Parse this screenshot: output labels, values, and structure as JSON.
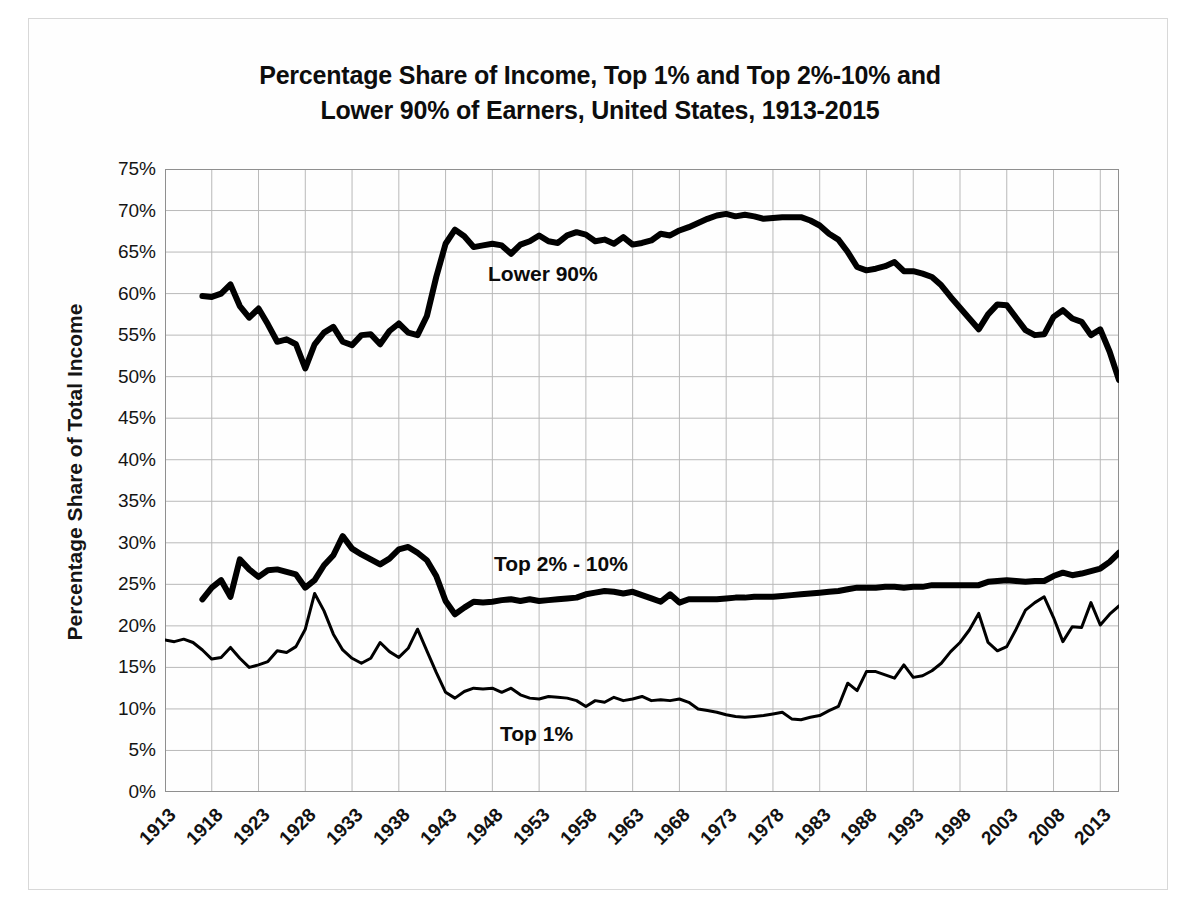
{
  "chart_data": {
    "type": "line",
    "title": "Percentage Share of Income, Top 1% and Top 2%-10% and Lower 90% of Earners, United States, 1913-2015",
    "title_line1": "Percentage Share of Income, Top 1% and Top 2%-10% and",
    "title_line2": "Lower 90% of Earners, United States, 1913-2015",
    "xlabel": "",
    "ylabel": "Percentage Share of Total Income",
    "ylim": [
      0,
      75
    ],
    "xlim": [
      1913,
      2015
    ],
    "grid": true,
    "legend_position": "inline-annotations",
    "ytick_labels": [
      "75%",
      "70%",
      "65%",
      "60%",
      "55%",
      "50%",
      "45%",
      "40%",
      "35%",
      "30%",
      "25%",
      "20%",
      "15%",
      "10%",
      "5%",
      "0%"
    ],
    "ytick_values": [
      75,
      70,
      65,
      60,
      55,
      50,
      45,
      40,
      35,
      30,
      25,
      20,
      15,
      10,
      5,
      0
    ],
    "xtick_labels": [
      "1913",
      "1918",
      "1923",
      "1928",
      "1933",
      "1938",
      "1943",
      "1948",
      "1953",
      "1958",
      "1963",
      "1968",
      "1973",
      "1978",
      "1983",
      "1988",
      "1993",
      "1998",
      "2003",
      "2008",
      "2013"
    ],
    "xtick_values": [
      1913,
      1918,
      1923,
      1928,
      1933,
      1938,
      1943,
      1948,
      1953,
      1958,
      1963,
      1968,
      1973,
      1978,
      1983,
      1988,
      1993,
      1998,
      2003,
      2008,
      2013
    ],
    "annotations": [
      {
        "text": "Lower 90%",
        "series": "Lower 90%"
      },
      {
        "text": "Top 2% - 10%",
        "series": "Top 2% - 10%"
      },
      {
        "text": "Top 1%",
        "series": "Top 1%"
      }
    ],
    "series": [
      {
        "name": "Lower 90%",
        "color": "#000000",
        "line_width": 6,
        "x": [
          1917,
          1918,
          1919,
          1920,
          1921,
          1922,
          1923,
          1924,
          1925,
          1926,
          1927,
          1928,
          1929,
          1930,
          1931,
          1932,
          1933,
          1934,
          1935,
          1936,
          1937,
          1938,
          1939,
          1940,
          1941,
          1942,
          1943,
          1944,
          1945,
          1946,
          1947,
          1948,
          1949,
          1950,
          1951,
          1952,
          1953,
          1954,
          1955,
          1956,
          1957,
          1958,
          1959,
          1960,
          1961,
          1962,
          1963,
          1964,
          1965,
          1966,
          1967,
          1968,
          1969,
          1970,
          1971,
          1972,
          1973,
          1974,
          1975,
          1976,
          1977,
          1978,
          1979,
          1980,
          1981,
          1982,
          1983,
          1984,
          1985,
          1986,
          1987,
          1988,
          1989,
          1990,
          1991,
          1992,
          1993,
          1994,
          1995,
          1996,
          1997,
          1998,
          1999,
          2000,
          2001,
          2002,
          2003,
          2004,
          2005,
          2006,
          2007,
          2008,
          2009,
          2010,
          2011,
          2012,
          2013,
          2014,
          2015
        ],
        "y": [
          59.7,
          59.6,
          60.0,
          61.1,
          58.5,
          57.1,
          58.2,
          56.3,
          54.2,
          54.5,
          53.9,
          51.0,
          53.9,
          55.3,
          56.0,
          54.2,
          53.8,
          55.0,
          55.1,
          53.9,
          55.5,
          56.4,
          55.3,
          55.0,
          57.3,
          62.0,
          66.0,
          67.7,
          66.9,
          65.6,
          65.8,
          66.0,
          65.8,
          64.8,
          65.9,
          66.3,
          67.0,
          66.3,
          66.1,
          67.0,
          67.4,
          67.1,
          66.3,
          66.5,
          66.0,
          66.8,
          65.9,
          66.1,
          66.4,
          67.2,
          67.0,
          67.6,
          68.0,
          68.5,
          69.0,
          69.4,
          69.6,
          69.3,
          69.5,
          69.3,
          69.0,
          69.1,
          69.2,
          69.2,
          69.2,
          68.8,
          68.2,
          67.2,
          66.5,
          65.0,
          63.2,
          62.8,
          63.0,
          63.3,
          63.8,
          62.7,
          62.7,
          62.4,
          62.0,
          61.0,
          59.6,
          58.3,
          57.0,
          55.7,
          57.5,
          58.7,
          58.6,
          57.1,
          55.6,
          55.0,
          55.1,
          57.2,
          58.0,
          57.0,
          56.6,
          55.0,
          55.7,
          53.0,
          49.6
        ]
      },
      {
        "name": "Top 2% - 10%",
        "color": "#000000",
        "line_width": 6,
        "x": [
          1917,
          1918,
          1919,
          1920,
          1921,
          1922,
          1923,
          1924,
          1925,
          1926,
          1927,
          1928,
          1929,
          1930,
          1931,
          1932,
          1933,
          1934,
          1935,
          1936,
          1937,
          1938,
          1939,
          1940,
          1941,
          1942,
          1943,
          1944,
          1945,
          1946,
          1947,
          1948,
          1949,
          1950,
          1951,
          1952,
          1953,
          1954,
          1955,
          1956,
          1957,
          1958,
          1959,
          1960,
          1961,
          1962,
          1963,
          1964,
          1965,
          1966,
          1967,
          1968,
          1969,
          1970,
          1971,
          1972,
          1973,
          1974,
          1975,
          1976,
          1977,
          1978,
          1979,
          1980,
          1981,
          1982,
          1983,
          1984,
          1985,
          1986,
          1987,
          1988,
          1989,
          1990,
          1991,
          1992,
          1993,
          1994,
          1995,
          1996,
          1997,
          1998,
          1999,
          2000,
          2001,
          2002,
          2003,
          2004,
          2005,
          2006,
          2007,
          2008,
          2009,
          2010,
          2011,
          2012,
          2013,
          2014,
          2015
        ],
        "y": [
          23.2,
          24.6,
          25.5,
          23.5,
          28.0,
          26.8,
          25.9,
          26.7,
          26.8,
          26.5,
          26.2,
          24.6,
          25.5,
          27.3,
          28.5,
          30.8,
          29.3,
          28.6,
          28.0,
          27.4,
          28.1,
          29.2,
          29.5,
          28.8,
          27.9,
          26.0,
          23.0,
          21.4,
          22.2,
          22.9,
          22.8,
          22.9,
          23.1,
          23.2,
          23.0,
          23.2,
          23.0,
          23.1,
          23.2,
          23.3,
          23.4,
          23.8,
          24.0,
          24.2,
          24.1,
          23.9,
          24.1,
          23.7,
          23.3,
          22.9,
          23.8,
          22.8,
          23.2,
          23.2,
          23.2,
          23.2,
          23.3,
          23.4,
          23.4,
          23.5,
          23.5,
          23.5,
          23.6,
          23.7,
          23.8,
          23.9,
          24.0,
          24.1,
          24.2,
          24.4,
          24.6,
          24.6,
          24.6,
          24.7,
          24.7,
          24.6,
          24.7,
          24.7,
          24.9,
          24.9,
          24.9,
          24.9,
          24.9,
          24.9,
          25.3,
          25.4,
          25.5,
          25.4,
          25.3,
          25.4,
          25.4,
          26.0,
          26.4,
          26.1,
          26.3,
          26.6,
          26.9,
          27.7,
          28.8
        ]
      },
      {
        "name": "Top 1%",
        "color": "#000000",
        "line_width": 3,
        "x": [
          1913,
          1914,
          1915,
          1916,
          1917,
          1918,
          1919,
          1920,
          1921,
          1922,
          1923,
          1924,
          1925,
          1926,
          1927,
          1928,
          1929,
          1930,
          1931,
          1932,
          1933,
          1934,
          1935,
          1936,
          1937,
          1938,
          1939,
          1940,
          1941,
          1942,
          1943,
          1944,
          1945,
          1946,
          1947,
          1948,
          1949,
          1950,
          1951,
          1952,
          1953,
          1954,
          1955,
          1956,
          1957,
          1958,
          1959,
          1960,
          1961,
          1962,
          1963,
          1964,
          1965,
          1966,
          1967,
          1968,
          1969,
          1970,
          1971,
          1972,
          1973,
          1974,
          1975,
          1976,
          1977,
          1978,
          1979,
          1980,
          1981,
          1982,
          1983,
          1984,
          1985,
          1986,
          1987,
          1988,
          1989,
          1990,
          1991,
          1992,
          1993,
          1994,
          1995,
          1996,
          1997,
          1998,
          1999,
          2000,
          2001,
          2002,
          2003,
          2004,
          2005,
          2006,
          2007,
          2008,
          2009,
          2010,
          2011,
          2012,
          2013,
          2014,
          2015
        ],
        "y": [
          18.3,
          18.1,
          18.4,
          18.0,
          17.1,
          16.0,
          16.2,
          17.4,
          16.1,
          15.0,
          15.3,
          15.7,
          17.0,
          16.8,
          17.5,
          19.6,
          23.9,
          21.8,
          19.0,
          17.1,
          16.1,
          15.5,
          16.1,
          18.0,
          16.9,
          16.2,
          17.3,
          19.6,
          17.0,
          14.4,
          12.0,
          11.3,
          12.1,
          12.5,
          12.4,
          12.5,
          12.0,
          12.5,
          11.7,
          11.3,
          11.2,
          11.5,
          11.4,
          11.3,
          11.0,
          10.3,
          11.0,
          10.8,
          11.4,
          11.0,
          11.2,
          11.5,
          11.0,
          11.1,
          11.0,
          11.2,
          10.8,
          10.0,
          9.8,
          9.6,
          9.3,
          9.1,
          9.0,
          9.1,
          9.2,
          9.4,
          9.6,
          8.8,
          8.7,
          9.0,
          9.2,
          9.8,
          10.3,
          13.1,
          12.2,
          14.5,
          14.5,
          14.1,
          13.7,
          15.3,
          13.8,
          14.0,
          14.6,
          15.5,
          16.9,
          18.0,
          19.5,
          21.5,
          18.0,
          17.0,
          17.5,
          19.6,
          21.9,
          22.8,
          23.5,
          21.0,
          18.1,
          19.9,
          19.8,
          22.8,
          20.1,
          21.4,
          22.4
        ]
      }
    ]
  },
  "axes": {
    "ylabel": "Percentage Share of Total Income"
  },
  "labels": {
    "lower90": "Lower 90%",
    "top210": "Top 2% - 10%",
    "top1": "Top 1%"
  },
  "colors": {
    "line": "#000000",
    "grid": "#b9b9b9",
    "axis": "#8f8f8f",
    "background": "#ffffff",
    "text": "#111111"
  }
}
